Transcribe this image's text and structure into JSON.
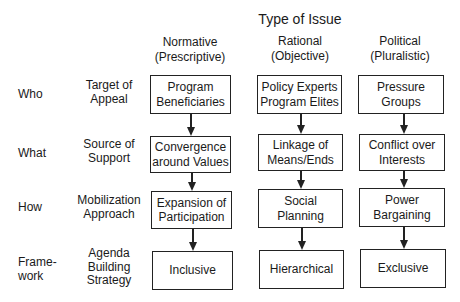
{
  "title": "Type of Issue",
  "columns": [
    {
      "name": "Normative",
      "sub": "(Prescriptive)"
    },
    {
      "name": "Rational",
      "sub": "(Objective)"
    },
    {
      "name": "Political",
      "sub": "(Pluralistic)"
    }
  ],
  "rows": [
    {
      "question": "Who",
      "dimension": "Target of\nAppeal"
    },
    {
      "question": "What",
      "dimension": "Source of\nSupport"
    },
    {
      "question": "How",
      "dimension": "Mobilization\nApproach"
    },
    {
      "question": "Frame-\nwork",
      "dimension": "Agenda\nBuilding\nStrategy"
    }
  ],
  "cells": [
    [
      "Program\nBeneficiaries",
      "Policy Experts\nProgram Elites",
      "Pressure\nGroups"
    ],
    [
      "Convergence\naround Values",
      "Linkage of\nMeans/Ends",
      "Conflict over\nInterests"
    ],
    [
      "Expansion of\nParticipation",
      "Social\nPlanning",
      "Power\nBargaining"
    ],
    [
      "Inclusive",
      "Hierarchical",
      "Exclusive"
    ]
  ]
}
